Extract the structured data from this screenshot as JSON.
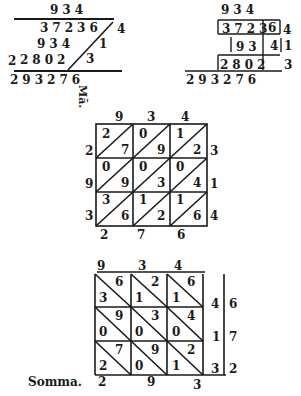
{
  "fig1": {
    "multiplicand": "934",
    "rows": [
      "37236",
      "934",
      "2802"
    ],
    "multiplier_digits": [
      "4",
      "1",
      "3"
    ],
    "lead": "2",
    "result": "293276"
  },
  "fig2": {
    "multiplicand": "934",
    "rows": [
      {
        "cells": "3723",
        "tail": "6",
        "m": "4"
      },
      {
        "cells": "93",
        "tail": "4",
        "m": "1"
      },
      {
        "cells": "2802",
        "tail": "3",
        "m": "3"
      }
    ],
    "result": "293276"
  },
  "label_vertical": "Mā.",
  "fig3": {
    "top": [
      "9",
      "3",
      "4"
    ],
    "left": [
      "2",
      "9",
      "3"
    ],
    "right": [
      "3",
      "1",
      "4"
    ],
    "bottom": [
      "2",
      "7",
      "6"
    ],
    "cells": [
      [
        [
          "2",
          "7"
        ],
        [
          "0",
          "9"
        ],
        [
          "1",
          "2"
        ]
      ],
      [
        [
          "0",
          "9"
        ],
        [
          "0",
          "3"
        ],
        [
          "0",
          "4"
        ]
      ],
      [
        [
          "3",
          "6"
        ],
        [
          "1",
          "2"
        ],
        [
          "1",
          "6"
        ]
      ]
    ]
  },
  "fig4": {
    "top": [
      "9",
      "3",
      "4"
    ],
    "right_inner": [
      "4",
      "1",
      "3"
    ],
    "right_outer": [
      "6",
      "7",
      "2"
    ],
    "bottom": [
      "2",
      "9",
      "3"
    ],
    "cells": [
      [
        [
          "6",
          "3"
        ],
        [
          "2",
          "1"
        ],
        [
          "6",
          "1"
        ]
      ],
      [
        [
          "9",
          "0"
        ],
        [
          "3",
          "0"
        ],
        [
          "4",
          "0"
        ]
      ],
      [
        [
          "7",
          "2"
        ],
        [
          "9",
          "0"
        ],
        [
          "2",
          "1"
        ]
      ]
    ],
    "somma_label": "Somma."
  }
}
